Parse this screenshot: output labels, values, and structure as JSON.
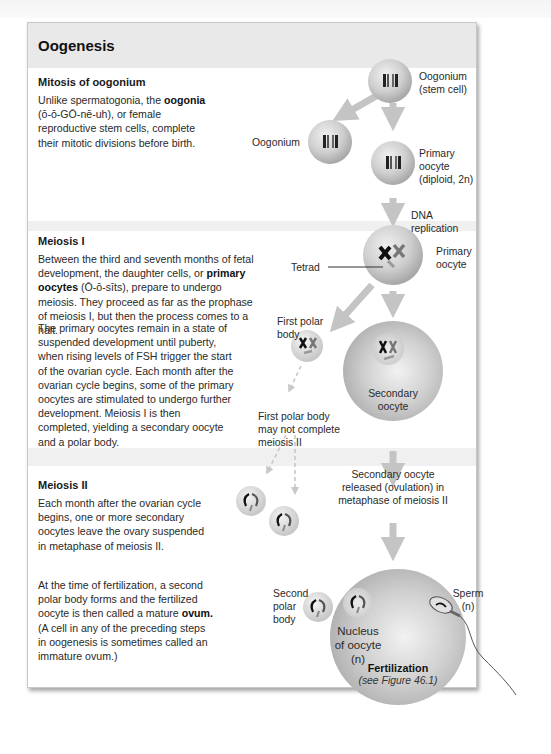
{
  "figure": {
    "title": "Oogenesis",
    "sections": [
      {
        "id": "mitosis",
        "heading": "Mitosis of oogonium",
        "paragraphs": [
          {
            "pre": "Unlike spermatogonia, the ",
            "bold": "oogonia",
            "post": " (ō-ō-GŌ-nē-uh), or female reproductive stem cells, complete their mitotic divisions before birth."
          }
        ]
      },
      {
        "id": "meiosis1",
        "heading": "Meiosis I",
        "paragraphs": [
          {
            "pre": "Between the third and seventh months of fetal development, the daughter cells, or ",
            "bold": "primary oocytes",
            "post": " (Ō-ō-sīts), prepare to undergo meiosis. They proceed as far as the prophase of meiosis I, but then the process comes to a halt."
          },
          {
            "text": "The primary oocytes remain in a state of suspended development until puberty, when rising levels of FSH trigger the start of the ovarian cycle. Each month after the ovarian cycle begins, some of the primary oocytes are stimulated to undergo further development. Meiosis I is then completed, yielding a secondary oocyte and a polar body."
          }
        ]
      },
      {
        "id": "meiosis2",
        "heading": "Meiosis II",
        "paragraphs": [
          {
            "text": "Each month after the ovarian cycle begins, one or more secondary oocytes leave the ovary suspended in metaphase of meiosis II."
          },
          {
            "pre": "At the time of fertilization, a second polar body forms and the fertilized oocyte is then called a mature ",
            "bold": "ovum.",
            "post": " (A cell in any of the preceding steps in oogenesis is sometimes called an immature ovum.)"
          }
        ]
      }
    ],
    "labels": {
      "oogonium_stem_1": "Oogonium",
      "oogonium_stem_2": "(stem cell)",
      "oogonium": "Oogonium",
      "primary_oocyte_1": "Primary",
      "primary_oocyte_2": "oocyte",
      "primary_oocyte_3": "(diploid, 2n)",
      "dna_replication": "DNA replication",
      "primary_oocyte_b1": "Primary",
      "primary_oocyte_b2": "oocyte",
      "tetrad": "Tetrad",
      "first_polar_body_1": "First polar",
      "first_polar_body_2": "body",
      "secondary_oocyte_1": "Secondary",
      "secondary_oocyte_2": "oocyte",
      "fpb_note_1": "First polar body",
      "fpb_note_2": "may not complete",
      "fpb_note_3": "meiosis II",
      "ovulation_1": "Secondary oocyte",
      "ovulation_2": "released (ovulation) in",
      "ovulation_3": "metaphase of meiosis II",
      "second_polar_1": "Second",
      "second_polar_2": "polar",
      "second_polar_3": "body",
      "nucleus_1": "Nucleus",
      "nucleus_2": "of oocyte",
      "nucleus_3": "(n)",
      "sperm_1": "Sperm",
      "sperm_2": "(n)",
      "fertilization": "Fertilization",
      "see_figure": "(see Figure 46.1)"
    },
    "colors": {
      "band": "#f0f0f0",
      "header": "#e9e9e9",
      "arrow": "#c4c4c4",
      "cell_light": "#e6e6e6",
      "cell_dark": "#a9a9a9"
    }
  }
}
